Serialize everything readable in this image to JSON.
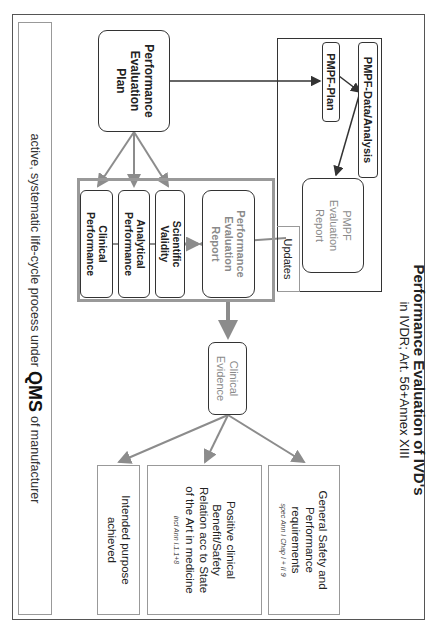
{
  "title": {
    "line1": "Performance Evaluation of IVD's",
    "line2": "in IVDR; Art. 56+Annex XIII"
  },
  "nodes": {
    "performance_evaluation_plan": "Performance Evaluation Plan",
    "pmpf_plan": "PMPF-Plan",
    "pmpf_data_analysis": "PMPF-Data/Analysis",
    "pmpf_evaluation_report": "PMPF Evaluation Report",
    "updates": "Updates",
    "scientific_validity": "Scientific Validity",
    "analytical_performance": "Analytical Performance",
    "clinical_performance": "Clinical Performance",
    "performance_evaluation_report": "Performance Evaluation Report",
    "clinical_evidence": "Clinical Evidence"
  },
  "outcomes": [
    {
      "text": "General Safety and Performance requirements",
      "note": "spec Ann I Chap I + II 9"
    },
    {
      "text": "Positive clinical Benefit/Safety Relation acc to State of the Art in medicine",
      "note": "incl Ann I.1.1+8"
    },
    {
      "text": "Intended purpose achieved",
      "note": ""
    }
  ],
  "footer": {
    "prefix": "active, systematic life-cycle process under",
    "emphasis": "QMS",
    "suffix": "of manufacturer"
  },
  "colors": {
    "dark_line": "#333333",
    "gray_line": "#8c8c8c",
    "gray_text": "#8a8a8a",
    "frame_gray": "#999999"
  }
}
